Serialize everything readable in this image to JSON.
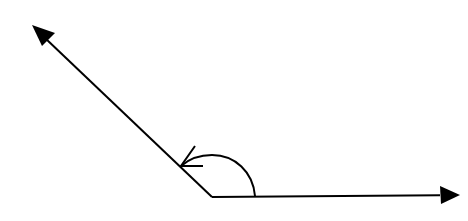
{
  "diagram": {
    "type": "angle",
    "stroke_color": "#000000",
    "background_color": "#ffffff",
    "vertex": {
      "x": 212,
      "y": 197
    },
    "rays": [
      {
        "name": "horizontal-ray",
        "from": {
          "x": 212,
          "y": 197
        },
        "to": {
          "x": 458,
          "y": 195
        },
        "arrowhead": true
      },
      {
        "name": "slanted-ray",
        "from": {
          "x": 212,
          "y": 197
        },
        "to": {
          "x": 33,
          "y": 26
        },
        "arrowhead": true
      }
    ],
    "angle_arc": {
      "start": {
        "x": 255,
        "y": 196
      },
      "end": {
        "x": 181,
        "y": 166
      },
      "direction": "counterclockwise",
      "arrowhead_at_end": true
    }
  }
}
